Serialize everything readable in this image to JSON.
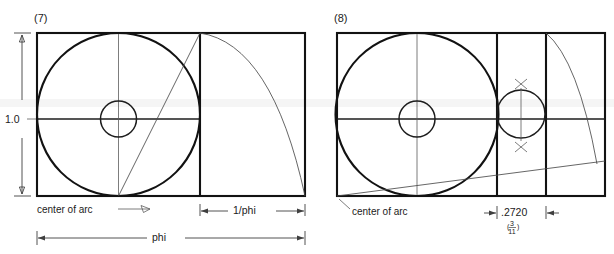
{
  "figure": {
    "title_hidden": "",
    "background_color": "#ffffff",
    "ink_color": "#121212",
    "panels": [
      {
        "id": "panel-7",
        "label": "(7)",
        "labels": {
          "height_dim": "1.0",
          "width_dim": "phi",
          "segment_dim": "1/phi",
          "arc_note": "center of arc"
        },
        "geometry": {
          "rect": {
            "x": 37,
            "y": 33,
            "w": 268,
            "h": 163
          },
          "square_divider_x": 200,
          "midline_y": 119,
          "big_circle": {
            "cx": 118.5,
            "cy": 114.5,
            "r": 81.5
          },
          "small_circle": {
            "cx": 118.5,
            "cy": 119,
            "r": 18
          },
          "diagonal": {
            "x1": 118.5,
            "y1": 196,
            "x2": 200,
            "y2": 33
          },
          "arc": {
            "from_x": 200,
            "from_y": 33,
            "to_x": 305,
            "to_y": 196
          }
        }
      },
      {
        "id": "panel-8",
        "label": "(8)",
        "labels": {
          "arc_note": "center of arc",
          "segment_dim": ".2720",
          "segment_fraction_numerator": "3",
          "segment_fraction_denominator": "11"
        },
        "geometry": {
          "rect": {
            "x": 337,
            "y": 33,
            "w": 268,
            "h": 163
          },
          "divider_x_1": 497,
          "divider_x_2": 546,
          "midline_y": 119,
          "center_line_x": 417,
          "big_circle": {
            "cx": 417,
            "cy": 114.5,
            "r": 81.5
          },
          "small_circle": {
            "cx": 417,
            "cy": 119,
            "r": 18
          },
          "mid_circle": {
            "cx": 521,
            "cy": 114,
            "r": 24
          },
          "tangent_line": {
            "x1": 337,
            "y1": 196,
            "x2": 605,
            "y2": 161
          },
          "arc": {
            "from_x": 546,
            "from_y": 33,
            "to_x": 597,
            "to_y": 164
          },
          "cross_marks": [
            {
              "cx": 521,
              "cy": 84
            },
            {
              "cx": 521,
              "cy": 148
            }
          ]
        }
      }
    ],
    "dimensions": {
      "vertical": {
        "value": "1.0",
        "x": 37,
        "top_y": 33,
        "bottom_y": 196,
        "line_x": 22
      },
      "phi_bar": {
        "x1": 37,
        "x2": 305,
        "y": 238,
        "label": "phi"
      },
      "inv_phi_bar": {
        "x1": 200,
        "x2": 305,
        "y": 211,
        "label": "1/phi"
      },
      "d2720_bar": {
        "x1": 497,
        "x2": 546,
        "y": 213,
        "label": ".2720"
      }
    }
  }
}
